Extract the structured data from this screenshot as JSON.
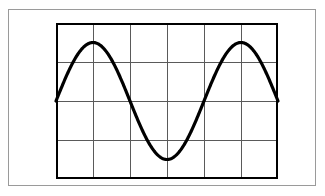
{
  "figure": {
    "title": "",
    "background_color": "#ffffff",
    "outer_border_color": "#9a9a9a",
    "grid_border_color": "#000000",
    "grid_line_color": "#5a5a5a",
    "curve_color": "#000000"
  },
  "chart_data": {
    "type": "line",
    "title": "",
    "xlabel": "",
    "ylabel": "",
    "grid": true,
    "legend": false,
    "xlim": [
      0,
      6
    ],
    "ylim": [
      -2,
      2
    ],
    "xticks": [
      0,
      1,
      2,
      3,
      4,
      5,
      6
    ],
    "yticks": [
      -2,
      -1,
      0,
      1,
      2
    ],
    "xtick_labels": [
      "",
      "",
      "",
      "",
      "",
      "",
      ""
    ],
    "ytick_labels": [
      "",
      "",
      "",
      "",
      ""
    ],
    "grid_columns": 6,
    "grid_rows": 4,
    "series": [
      {
        "name": "cosine wave",
        "equation": "y = 1.5 cos(2*pi*(x-1)/4)",
        "amplitude": 1.5,
        "period": 4,
        "phase_x_of_first_peak": 1,
        "x": [
          0.0,
          0.25,
          0.5,
          0.75,
          1.0,
          1.25,
          1.5,
          1.75,
          2.0,
          2.25,
          2.5,
          2.75,
          3.0,
          3.25,
          3.5,
          3.75,
          4.0,
          4.25,
          4.5,
          4.75,
          5.0,
          5.25,
          5.5,
          5.75,
          6.0
        ],
        "y": [
          0.0,
          0.574,
          1.061,
          1.386,
          1.5,
          1.386,
          1.061,
          0.574,
          0.0,
          -0.574,
          -1.061,
          -1.386,
          -1.5,
          -1.386,
          -1.061,
          -0.574,
          0.0,
          0.574,
          1.061,
          1.386,
          1.5,
          1.386,
          1.061,
          0.574,
          0.0
        ]
      }
    ],
    "annotations": {
      "peaks": [
        {
          "x": 1,
          "y": 1.5
        },
        {
          "x": 5,
          "y": 1.5
        }
      ],
      "troughs": [
        {
          "x": 3,
          "y": -1.5
        }
      ],
      "zero_crossings": [
        {
          "x": 0,
          "y": 0
        },
        {
          "x": 2,
          "y": 0
        },
        {
          "x": 4,
          "y": 0
        },
        {
          "x": 6,
          "y": 0
        }
      ]
    }
  }
}
